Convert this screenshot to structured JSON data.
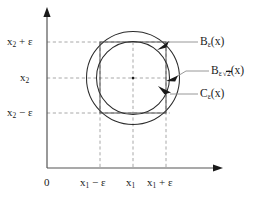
{
  "figure": {
    "type": "geometry-diagram",
    "origin_label": "0",
    "axes": {
      "x_axis": {
        "name": "x-axis",
        "arrow": "right"
      },
      "y_axis": {
        "name": "y-axis",
        "arrow": "up"
      }
    },
    "x_ticks": [
      {
        "id": "origin",
        "label": "0"
      },
      {
        "id": "x1-minus-eps",
        "base": "x",
        "sub": "1",
        "op": " − ",
        "term": "ε"
      },
      {
        "id": "x1",
        "base": "x",
        "sub": "1",
        "op": "",
        "term": ""
      },
      {
        "id": "x1-plus-eps",
        "base": "x",
        "sub": "1",
        "op": " + ",
        "term": "ε"
      }
    ],
    "y_ticks": [
      {
        "id": "x2-plus-eps",
        "base": "x",
        "sub": "2",
        "op": " + ",
        "term": "ε"
      },
      {
        "id": "x2",
        "base": "x",
        "sub": "2",
        "op": "",
        "term": ""
      },
      {
        "id": "x2-minus-eps",
        "base": "x",
        "sub": "2",
        "op": " − ",
        "term": "ε"
      }
    ],
    "annotations": [
      {
        "id": "inner-ball",
        "base": "B",
        "sub": "ε",
        "radical": false,
        "arg": "(x)"
      },
      {
        "id": "outer-ball",
        "base": "B",
        "sub": "ε",
        "radical": true,
        "radicand": "2",
        "arg": "(x)"
      },
      {
        "id": "cube",
        "base": "C",
        "sub": "ε",
        "radical": false,
        "arg": "(x)"
      }
    ],
    "shapes": {
      "center": {
        "cx": 133,
        "cy": 78
      },
      "square": {
        "x": 100,
        "y": 42,
        "w": 66,
        "h": 71
      },
      "inner_circle": {
        "cx": 133,
        "cy": 78,
        "r": 36.5
      },
      "outer_circle": {
        "cx": 133,
        "cy": 78,
        "r": 46.5
      }
    },
    "colors": {
      "stroke": "#1a1a1a",
      "dashed": "#9a9a9a",
      "leader": "#8a8a8a",
      "background": "#ffffff"
    }
  }
}
